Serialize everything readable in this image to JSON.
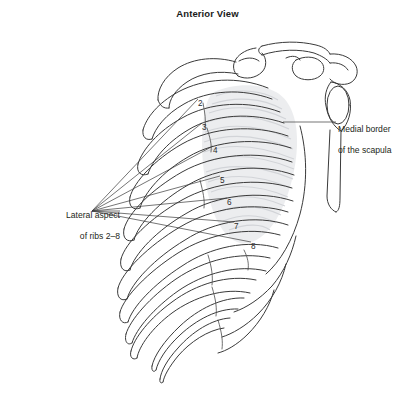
{
  "figure": {
    "title": "Anterior View",
    "background_color": "#ffffff",
    "line_color": "#3a3a3a",
    "shade_color": "#e9eaec",
    "text_color": "#231f20"
  },
  "callouts": [
    {
      "id": "medial-border",
      "text": "Medial border\nof the scapula",
      "line_1": "Medial border",
      "line_2": "of the scapula",
      "position": "right",
      "leader_from_x": 336,
      "leader_to_x": 283,
      "leader_y": 122
    },
    {
      "id": "lateral-aspect",
      "text": "Lateral aspect\nof ribs 2–8",
      "line_1": "Lateral aspect",
      "line_2": "of ribs 2–8",
      "position": "left",
      "converge_x": 92,
      "converge_y": 211
    }
  ],
  "rib_numbers": [
    {
      "label": "2",
      "x": 198,
      "y": 100
    },
    {
      "label": "3",
      "x": 202,
      "y": 124
    },
    {
      "label": "4",
      "x": 213,
      "y": 147
    },
    {
      "label": "5",
      "x": 220,
      "y": 177
    },
    {
      "label": "6",
      "x": 227,
      "y": 199
    },
    {
      "label": "7",
      "x": 234,
      "y": 223
    },
    {
      "label": "8",
      "x": 251,
      "y": 243
    }
  ],
  "anatomy": {
    "structures": [
      "clavicle",
      "acromion",
      "coracoid process",
      "glenoid fossa",
      "scapula body",
      "medial border of scapula",
      "ribs 1-12",
      "costal cartilages",
      "sternum",
      "floating ribs"
    ]
  }
}
